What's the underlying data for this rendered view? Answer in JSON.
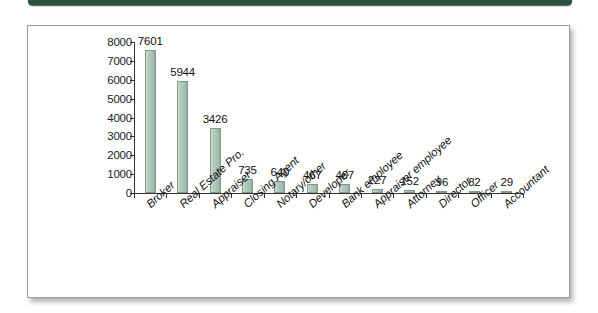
{
  "page": {
    "band_color": "#28523f",
    "panel_bg": "#ffffff",
    "panel_border": "#9a9a9a"
  },
  "chart_data": {
    "type": "bar",
    "title": "",
    "subtitle": "",
    "xlabel": "",
    "ylabel": "",
    "ylim": [
      0,
      8000
    ],
    "grid": false,
    "legend": "none",
    "bar_color": "#a8c0b3",
    "bar_edge_color": "#7d9a8b",
    "ytick_labels": [
      "8000",
      "7000",
      "6000",
      "5000",
      "4000",
      "3000",
      "2000",
      "1000",
      "0"
    ],
    "ytick_values": [
      8000,
      7000,
      6000,
      5000,
      4000,
      3000,
      2000,
      1000,
      0
    ],
    "categories": [
      "Broker",
      "Real Estate Pro.",
      "Appraiser",
      "Closing Agent",
      "Notary/other",
      "Developer",
      "Bank employee",
      "Appraiser employee",
      "Attorney",
      "Director",
      "Officer",
      "Accountant"
    ],
    "values": [
      7601,
      5944,
      3426,
      735,
      640,
      467,
      467,
      227,
      152,
      96,
      82,
      29
    ],
    "value_labels": [
      "7601",
      "5944",
      "3426",
      "735",
      "640",
      "467",
      "467",
      "227",
      "152",
      "96",
      "82",
      "29"
    ]
  }
}
